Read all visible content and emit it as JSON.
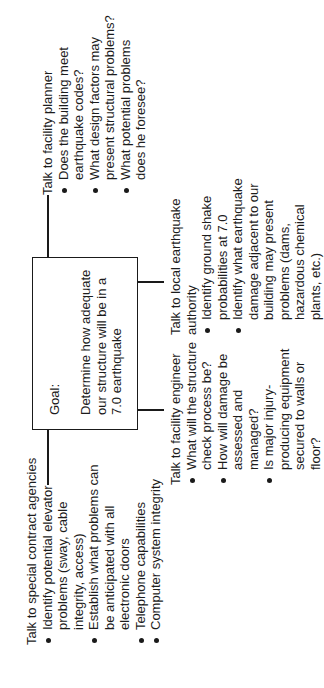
{
  "goal": {
    "label": "Goal:",
    "text": "Determine how adequate our structure will be in a 7.0 earthquake"
  },
  "branches": {
    "facility_planner": {
      "heading": "Talk to facility planner",
      "items": [
        "Does the building meet earthquake codes?",
        "What design factors may present structural problems?",
        "What potential problems does he foresee?"
      ]
    },
    "special_contract": {
      "heading": "Talk to special contract agencies",
      "items": [
        "Identify potential elevator problems (sway, cable integrity, access)",
        "Establish what problems can be anticipated with all electronic doors",
        "Telephone capabilities",
        "Computer system integrity"
      ]
    },
    "facility_engineer": {
      "heading": "Talk to facility engineer",
      "items": [
        "What will the structure check process be?",
        "How will damage be assessed and managed?",
        "Is major injury-producing equipment secured to walls or floor?"
      ]
    },
    "earthquake_authority": {
      "heading": "Talk to local earthquake authority",
      "items": [
        "Identify ground shake probabilities at 7.0",
        "Identify what earthquake damage adjacent to our building may present problems (dams, hazardous chemical plants, etc.)"
      ]
    }
  }
}
